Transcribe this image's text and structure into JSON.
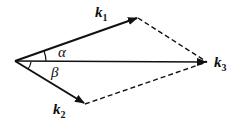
{
  "diagram": {
    "vectors": [
      {
        "name": "k1",
        "label": "k",
        "sub": "1",
        "from": [
          15,
          61
        ],
        "to": [
          138,
          18
        ]
      },
      {
        "name": "k2",
        "label": "k",
        "sub": "2",
        "from": [
          15,
          61
        ],
        "to": [
          85,
          104
        ]
      },
      {
        "name": "k3",
        "label": "k",
        "sub": "3",
        "from": [
          15,
          61
        ],
        "to": [
          207,
          62
        ]
      }
    ],
    "angles": [
      {
        "name": "alpha",
        "label": "α",
        "between": [
          "k1",
          "k3"
        ]
      },
      {
        "name": "beta",
        "label": "β",
        "between": [
          "k3",
          "k2"
        ]
      }
    ],
    "dashed_edges": [
      [
        "k1_tip",
        "k3_tip"
      ],
      [
        "k2_tip",
        "k3_tip"
      ]
    ]
  }
}
